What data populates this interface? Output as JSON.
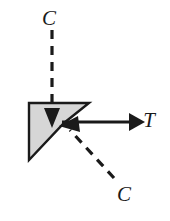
{
  "figure": {
    "background_color": "#ffffff",
    "width": 170,
    "height": 221
  },
  "block": {
    "name": "wedge-block",
    "fill_color": "#d6d6d6",
    "stroke_color": "#1a1a1a",
    "stroke_width": 2.4,
    "points": "29,103 89,103 64,123 29,160"
  },
  "vectors": [
    {
      "id": "c-top",
      "label": "C",
      "type": "compression",
      "style": "dashed",
      "direction": "down",
      "color": "#1a1a1a",
      "line": {
        "x1": 52,
        "y1": 30,
        "x2": 52,
        "y2": 112
      },
      "dash_pattern": "9 7",
      "stroke_width": 3.2,
      "label_pos": {
        "x": 49,
        "y": 20
      }
    },
    {
      "id": "c-bottom",
      "label": "C",
      "type": "compression",
      "style": "dashed",
      "direction": "up-left",
      "color": "#1a1a1a",
      "line": {
        "x1": 114,
        "y1": 178,
        "x2": 66,
        "y2": 126
      },
      "dash_pattern": "9 7",
      "stroke_width": 3.2,
      "label_pos": {
        "x": 124,
        "y": 196
      }
    },
    {
      "id": "t-right",
      "label": "T",
      "type": "tension",
      "style": "solid",
      "direction": "right",
      "color": "#1a1a1a",
      "line": {
        "x1": 62,
        "y1": 122,
        "x2": 132,
        "y2": 122
      },
      "stroke_width": 3.0,
      "label_pos": {
        "x": 149,
        "y": 122
      }
    }
  ],
  "arrowheads": {
    "color": "#1a1a1a",
    "c_top": "44,108 60,108 52,128",
    "c_bottom": "78,116 80,132 59,126",
    "t_right": "129,113 145,122 129,131"
  }
}
